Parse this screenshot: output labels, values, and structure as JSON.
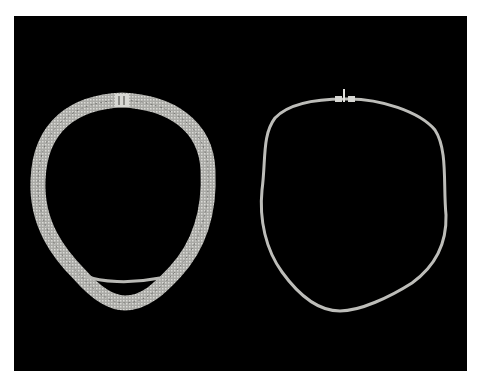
{
  "image": {
    "subject": "two silver chain necklaces on black background",
    "background_color": "#000000",
    "frame_color": "#ffffff",
    "metal_color": "#c8c8c4",
    "items": [
      {
        "name": "multi-strand necklace with box clasp"
      },
      {
        "name": "single-strand necklace with toggle clasp"
      }
    ]
  }
}
